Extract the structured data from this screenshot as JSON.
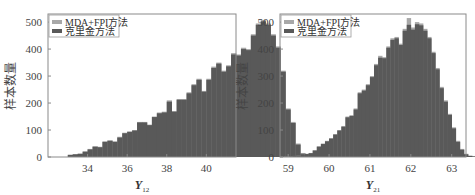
{
  "chart_data": [
    {
      "type": "bar",
      "subtype": "histogram-overlay",
      "title": "",
      "xlabel": "Y",
      "xlabel_subscript": "12",
      "ylabel": "样本数量",
      "xlim": [
        32.0,
        41.5
      ],
      "ylim": [
        0,
        530
      ],
      "xticks": [
        34,
        36,
        38,
        40
      ],
      "yticks": [
        0,
        100,
        200,
        300,
        400,
        500
      ],
      "legend_position": "upper left",
      "grid": false,
      "bin_width": 0.25,
      "bin_start": 33.0,
      "series": [
        {
          "name": "MDA+FPI方法",
          "color": "#a8a8a8",
          "values": [
            8,
            10,
            12,
            20,
            30,
            40,
            38,
            58,
            62,
            58,
            75,
            90,
            95,
            100,
            130,
            130,
            120,
            150,
            165,
            168,
            210,
            170,
            215,
            215,
            240,
            270,
            290,
            245,
            290,
            335,
            350,
            320,
            340,
            385,
            380,
            405,
            400,
            455,
            495,
            508,
            495,
            455,
            410,
            320,
            180,
            130,
            50,
            15,
            3
          ]
        },
        {
          "name": "克里金方法",
          "color": "#595959",
          "values": [
            8,
            10,
            12,
            20,
            28,
            38,
            36,
            56,
            60,
            56,
            72,
            88,
            93,
            98,
            128,
            128,
            118,
            148,
            162,
            165,
            205,
            168,
            212,
            212,
            236,
            266,
            286,
            242,
            286,
            330,
            346,
            316,
            336,
            380,
            376,
            400,
            396,
            450,
            490,
            503,
            490,
            450,
            405,
            316,
            176,
            126,
            46,
            12,
            2
          ]
        }
      ]
    },
    {
      "type": "bar",
      "subtype": "histogram-overlay",
      "title": "",
      "xlabel": "Y",
      "xlabel_subscript": "21",
      "ylabel": "样本数量",
      "xlim": [
        58.8,
        63.35
      ],
      "ylim": [
        0,
        530
      ],
      "xticks": [
        59,
        60,
        61,
        62,
        63
      ],
      "yticks": [
        0,
        100,
        200,
        300,
        400,
        500
      ],
      "legend_position": "upper left",
      "grid": false,
      "bin_width": 0.1,
      "bin_start": 58.9,
      "series": [
        {
          "name": "MDA+FPI方法",
          "color": "#a8a8a8",
          "values": [
            2,
            3,
            4,
            5,
            8,
            12,
            15,
            25,
            40,
            50,
            60,
            70,
            85,
            100,
            115,
            150,
            155,
            180,
            240,
            250,
            270,
            300,
            345,
            375,
            370,
            410,
            440,
            445,
            420,
            475,
            515,
            480,
            500,
            495,
            475,
            445,
            390,
            330,
            260,
            210,
            160,
            110,
            60,
            30,
            12,
            5,
            3
          ]
        },
        {
          "name": "克里金方法",
          "color": "#595959",
          "values": [
            2,
            3,
            4,
            5,
            8,
            11,
            14,
            24,
            38,
            48,
            58,
            68,
            83,
            98,
            112,
            147,
            152,
            176,
            236,
            246,
            266,
            296,
            340,
            368,
            366,
            405,
            434,
            440,
            415,
            468,
            490,
            472,
            492,
            488,
            468,
            440,
            385,
            325,
            255,
            205,
            156,
            106,
            56,
            27,
            10,
            4,
            2
          ]
        }
      ]
    }
  ],
  "panels": [
    {
      "ylabel": "样本数量",
      "xlabel_main": "Y",
      "xlabel_sub": "12",
      "legend": [
        "MDA+FPI方法",
        "克里金方法"
      ]
    },
    {
      "ylabel": "样本数量",
      "xlabel_main": "Y",
      "xlabel_sub": "21",
      "legend": [
        "MDA+FPI方法",
        "克里金方法"
      ]
    }
  ]
}
